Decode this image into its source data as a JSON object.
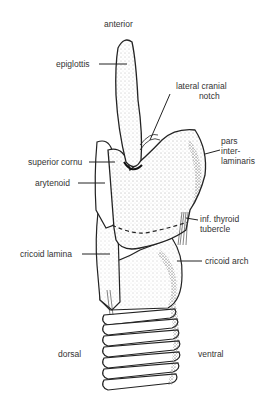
{
  "figure": {
    "orientation": {
      "top": "anterior",
      "bottom_left": "dorsal",
      "bottom_right": "ventral"
    },
    "labels": [
      {
        "id": "epiglottis",
        "text": "epiglottis"
      },
      {
        "id": "lateral-cranial-notch",
        "text": "lateral cranial notch",
        "lines": [
          "lateral cranial",
          "notch"
        ]
      },
      {
        "id": "pars-interlaminaris",
        "text": "pars interlaminaris",
        "lines": [
          "pars",
          "inter-",
          "laminaris"
        ]
      },
      {
        "id": "superior-cornu",
        "text": "superior cornu"
      },
      {
        "id": "arytenoid",
        "text": "arytenoid"
      },
      {
        "id": "inf-thyroid-tubercle",
        "text": "inf. thyroid tubercle",
        "lines": [
          "inf. thyroid",
          "tubercle"
        ]
      },
      {
        "id": "cricoid-lamina",
        "text": "cricoid lamina"
      },
      {
        "id": "cricoid-arch",
        "text": "cricoid arch"
      }
    ]
  }
}
